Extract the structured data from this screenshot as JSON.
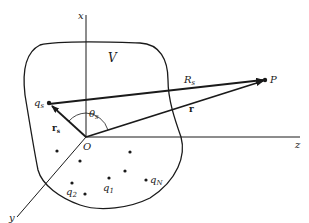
{
  "diagram": {
    "axes": {
      "x_label": "x",
      "y_label": "y",
      "z_label": "z",
      "origin_label": "O"
    },
    "region_label": "ᵋ1",
    "region_label_plain": "V",
    "vectors": {
      "R_s": {
        "label": "R",
        "subscript": "s"
      },
      "r": {
        "label": "r"
      },
      "r_s": {
        "label": "r",
        "subscript": "s"
      }
    },
    "angle": {
      "label": "θ",
      "subscript": "s"
    },
    "points": {
      "P": {
        "label": "P"
      },
      "q_s": {
        "label": "q",
        "subscript": "s"
      },
      "q_1": {
        "label": "q",
        "subscript": "1"
      },
      "q_2": {
        "label": "q",
        "subscript": "2"
      },
      "q_N": {
        "label": "q",
        "subscript": "N"
      }
    },
    "colors": {
      "ink": "#1a1a1a",
      "background": "#ffffff"
    }
  }
}
